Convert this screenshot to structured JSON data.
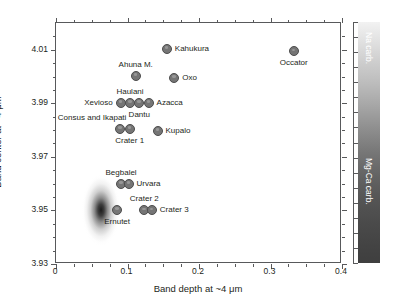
{
  "chart_data": {
    "type": "scatter",
    "title": "",
    "xlabel": "Band depth at ~4 μm",
    "ylabel": "Band center at ~4 μm",
    "xlim": [
      0,
      0.4
    ],
    "ylim": [
      3.93,
      4.01999
    ],
    "xticks": [
      0,
      0.1,
      0.2,
      0.3,
      0.4
    ],
    "xticklabels": [
      "0",
      "0.1",
      "0.2",
      "0.3",
      "0.4"
    ],
    "yticks": [
      3.93,
      3.95,
      3.97,
      3.99,
      4.01
    ],
    "yticklabels": [
      "3.93",
      "3.95",
      "3.97",
      "3.99",
      "4.01"
    ],
    "x_minor_step": 0.025,
    "y_minor_step": 0.005,
    "grid": false,
    "legend": "none",
    "marker_color": "#757575",
    "marker_edge_color": "#4d4d4d",
    "points": [
      {
        "name": "Kahukura",
        "x": 0.155,
        "y": 4.0103,
        "label": "Kahukura",
        "label_pos": "right"
      },
      {
        "name": "Occator",
        "x": 0.3325,
        "y": 4.0095,
        "label": "Occator",
        "label_pos": "below"
      },
      {
        "name": "Ahuna M.",
        "x": 0.1115,
        "y": 4.0002,
        "label": "Ahuna M.",
        "label_pos": "above"
      },
      {
        "name": "Oxo",
        "x": 0.1655,
        "y": 3.9995,
        "label": "Oxo",
        "label_pos": "right"
      },
      {
        "name": "Xevioso",
        "x": 0.0905,
        "y": 3.9903,
        "label": "Xevioso",
        "label_pos": "left"
      },
      {
        "name": "Haulani",
        "x": 0.1035,
        "y": 3.9903,
        "label": "Haulani",
        "label_pos": "above"
      },
      {
        "name": "Dantu",
        "x": 0.1165,
        "y": 3.9903,
        "label": "Dantu",
        "label_pos": "below"
      },
      {
        "name": "Azacca",
        "x": 0.1295,
        "y": 3.9903,
        "label": "Azacca",
        "label_pos": "right"
      },
      {
        "name": "Consus and Ikapati",
        "x": 0.09,
        "y": 3.9805,
        "label": "Consus and Ikapati",
        "label_pos": "above-left"
      },
      {
        "name": "Crater 1",
        "x": 0.103,
        "y": 3.9805,
        "label": "Crater 1",
        "label_pos": "below"
      },
      {
        "name": "Kupalo",
        "x": 0.142,
        "y": 3.9798,
        "label": "Kupalo",
        "label_pos": "right"
      },
      {
        "name": "Begbalel",
        "x": 0.091,
        "y": 3.96,
        "label": "Begbalel",
        "label_pos": "above"
      },
      {
        "name": "Urvara",
        "x": 0.1015,
        "y": 3.96,
        "label": "Urvara",
        "label_pos": "right"
      },
      {
        "name": "Ernutet",
        "x": 0.0855,
        "y": 3.9503,
        "label": "Ernutet",
        "label_pos": "below"
      },
      {
        "name": "Crater 2",
        "x": 0.1235,
        "y": 3.95,
        "label": "Crater 2",
        "label_pos": "above"
      },
      {
        "name": "Crater 3",
        "x": 0.134,
        "y": 3.95,
        "label": "Crater 3",
        "label_pos": "right"
      }
    ],
    "density_cloud": {
      "name": "background-density",
      "center_x": 0.063,
      "center_y": 3.95,
      "spread_x": 0.011,
      "spread_y": 0.007,
      "description": "dark elongated density distribution of global Ceres surface"
    },
    "colorbar": {
      "top_label": "Na carb.",
      "bottom_label": "Mg-Ca carb.",
      "top_color": "#f2f2f2",
      "bottom_color": "#3f3f3f",
      "orientation": "vertical"
    }
  }
}
